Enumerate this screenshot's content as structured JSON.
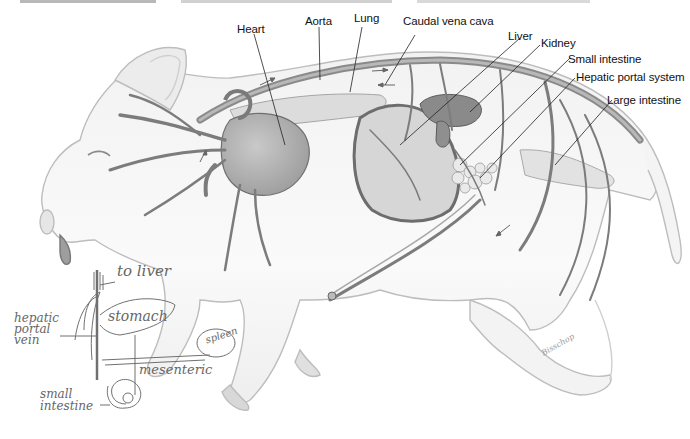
{
  "figure": {
    "caption_clipped": true
  },
  "labels": {
    "heart": "Heart",
    "aorta": "Aorta",
    "lung": "Lung",
    "caudal_vena_cava": "Caudal vena cava",
    "liver": "Liver",
    "kidney": "Kidney",
    "small_intestine": "Small intestine",
    "hepatic_portal_system": "Hepatic portal system",
    "large_intestine": "Large intestine"
  },
  "handwritten_notes": {
    "to_liver": "to liver",
    "hepatic_portal_vein": [
      "hepatic",
      "portal",
      "vein"
    ],
    "stomach": "stomach",
    "spleen": "spleen",
    "mesenteric": "mesenteric",
    "small_intestine": [
      "small",
      "intestine"
    ]
  },
  "signature": "Bisschop",
  "colors": {
    "vessel": "#7a7a7a",
    "vessel_dark": "#555555",
    "organ": "#8c8c8c",
    "body_outline": "#bdbdbd",
    "pencil": "#6a6a6a",
    "leader_line": "#222222"
  }
}
